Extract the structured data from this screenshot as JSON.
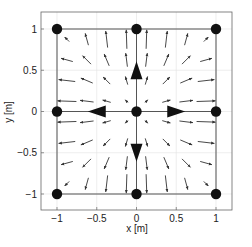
{
  "chart_data": {
    "type": "quiver",
    "title": "",
    "xlabel": "x [m]",
    "ylabel": "y [m]",
    "xlim": [
      -1.2,
      1.2
    ],
    "ylim": [
      -1.2,
      1.2
    ],
    "xticks": [
      -1,
      -0.5,
      0,
      0.5,
      1
    ],
    "xtick_labels": [
      "−1",
      "−0.5",
      "0",
      "0.5",
      "1"
    ],
    "yticks": [
      -1,
      -0.5,
      0,
      0.5,
      1
    ],
    "ytick_labels": [
      "−1",
      "−0.5",
      "0",
      "0.5",
      "1"
    ],
    "grid": true,
    "nodes": [
      {
        "x": -1,
        "y": 1
      },
      {
        "x": 0,
        "y": 1
      },
      {
        "x": 1,
        "y": 1
      },
      {
        "x": -1,
        "y": 0
      },
      {
        "x": 0,
        "y": 0
      },
      {
        "x": 1,
        "y": 0
      },
      {
        "x": -1,
        "y": -1
      },
      {
        "x": 0,
        "y": -1
      },
      {
        "x": 1,
        "y": -1
      }
    ],
    "edges": [
      [
        [
          -1,
          1
        ],
        [
          1,
          1
        ]
      ],
      [
        [
          -1,
          -1
        ],
        [
          1,
          -1
        ]
      ],
      [
        [
          -1,
          1
        ],
        [
          -1,
          -1
        ]
      ],
      [
        [
          1,
          1
        ],
        [
          1,
          -1
        ]
      ],
      [
        [
          -1,
          0
        ],
        [
          1,
          0
        ]
      ],
      [
        [
          0,
          1
        ],
        [
          0,
          -1
        ]
      ]
    ],
    "large_arrows": [
      {
        "x": 0,
        "y": 0.5,
        "direction": "up"
      },
      {
        "x": 0,
        "y": -0.5,
        "direction": "down"
      },
      {
        "x": -0.5,
        "y": 0,
        "direction": "left"
      },
      {
        "x": 0.5,
        "y": 0,
        "direction": "right"
      }
    ],
    "vector_field": {
      "description": "outward-radiating field from origin, vanishing toward corners",
      "grid_x": [
        -0.875,
        -0.625,
        -0.375,
        -0.125,
        0.125,
        0.375,
        0.625,
        0.875
      ],
      "grid_y": [
        -0.875,
        -0.625,
        -0.375,
        -0.125,
        0.125,
        0.375,
        0.625,
        0.875
      ],
      "u_formula": "x*(1-y^2)",
      "v_formula": "y*(1-x^2)"
    }
  },
  "colors": {
    "ink": "#111111",
    "axes": "#555555",
    "grid": "#dddddd",
    "background": "#ffffff"
  }
}
